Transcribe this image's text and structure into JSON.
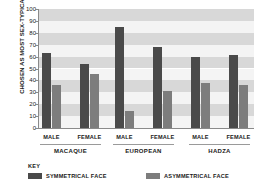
{
  "chart_data": {
    "type": "bar",
    "title": "",
    "subtitle": "",
    "xlabel": "",
    "ylabel": "CHOSEN AS MOST SEX-TYPICAL (%)",
    "ylim": [
      0,
      100
    ],
    "grid": "horizontal-bands",
    "legend_position": "bottom",
    "legend_title": "KEY",
    "yticks": [
      "0",
      "10",
      "20",
      "30",
      "40",
      "50",
      "60",
      "70",
      "80",
      "90",
      "100"
    ],
    "ytick_values": [
      0,
      10,
      20,
      30,
      40,
      50,
      60,
      70,
      80,
      90,
      100
    ],
    "groups": [
      "MACAQUE",
      "EUROPEAN",
      "HADZA"
    ],
    "categories": [
      "MACAQUE MALE",
      "MACAQUE FEMALE",
      "EUROPEAN MALE",
      "EUROPEAN FEMALE",
      "HADZA MALE",
      "HADZA FEMALE"
    ],
    "sex_labels": [
      "MALE",
      "FEMALE",
      "MALE",
      "FEMALE",
      "MALE",
      "FEMALE"
    ],
    "series": [
      {
        "name": "SYMMETRICAL FACE",
        "color": "#4a4a4a",
        "values": [
          63,
          54,
          85,
          68,
          60,
          61
        ]
      },
      {
        "name": "ASYMMETRICAL FACE",
        "color": "#7d7d7d",
        "values": [
          36,
          45,
          14,
          31,
          38,
          36
        ]
      }
    ]
  },
  "colors": {
    "symmetrical": "#4a4a4a",
    "asymmetrical": "#7d7d7d",
    "band_light": "#d8d8d8",
    "band_white": "#f4f4f4",
    "axis": "#8a8a8a",
    "text": "#1a1a1a"
  }
}
